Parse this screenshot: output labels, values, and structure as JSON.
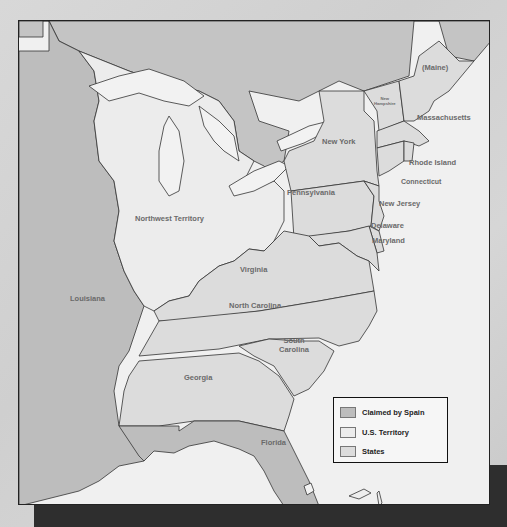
{
  "map": {
    "colors": {
      "claimed_by_spain": "#bdbdbd",
      "us_territory": "#ececec",
      "states": "#dcdcdc",
      "water": "#f2f2f2",
      "foreign": "#c4c4c4",
      "border": "#333333"
    },
    "regions": {
      "maine": "(Maine)",
      "new_hampshire_line1": "New",
      "new_hampshire_line2": "Hampshire",
      "massachusetts": "Massachusetts",
      "new_york": "New York",
      "rhode_island": "Rhode Island",
      "connecticut": "Connecticut",
      "pennsylvania": "Pennsylvania",
      "new_jersey": "New Jersey",
      "northwest_territory": "Northwest Territory",
      "delaware": "Delaware",
      "maryland": "Maryland",
      "virginia": "Virginia",
      "louisiana": "Louisiana",
      "north_carolina": "North Carolina",
      "south_carolina_line1": "South",
      "south_carolina_line2": "Carolina",
      "georgia": "Georgia",
      "florida": "Florida"
    },
    "legend": {
      "items": [
        {
          "label": "Claimed by Spain",
          "color": "#bdbdbd"
        },
        {
          "label": "U.S. Territory",
          "color": "#ececec"
        },
        {
          "label": "States",
          "color": "#dcdcdc"
        }
      ]
    }
  }
}
